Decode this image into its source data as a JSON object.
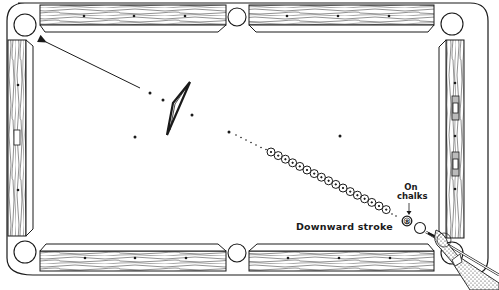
{
  "figure": {
    "labels": {
      "stroke": "Downward stroke",
      "chalk_line1": "On",
      "chalk_line2": "chalks",
      "eight_ball": "8"
    },
    "table": {
      "pockets": [
        "top-left",
        "top-middle",
        "top-right",
        "bottom-left",
        "bottom-middle",
        "bottom-right"
      ],
      "rail_style": "wood grain",
      "line_color": "#1a1a1a",
      "background": "#ffffff"
    },
    "elements": {
      "ball_row_count": 17,
      "arrow_direction": "toward top-left pocket",
      "rack": "triangle rack (tilted)",
      "cue": "cue stick held by hand at bottom-right"
    }
  }
}
